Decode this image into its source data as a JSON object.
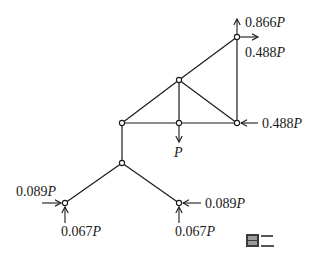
{
  "figure": {
    "caption": "图二",
    "caption_glyph_rendered": "图 (pixelated) + 二"
  },
  "structure": {
    "nodes": [
      {
        "id": "A",
        "x": 237,
        "y": 37,
        "role": "top-right"
      },
      {
        "id": "B",
        "x": 179,
        "y": 80,
        "role": "upper-middle"
      },
      {
        "id": "C",
        "x": 122,
        "y": 123,
        "role": "left"
      },
      {
        "id": "D",
        "x": 179,
        "y": 123,
        "role": "middle"
      },
      {
        "id": "E",
        "x": 237,
        "y": 123,
        "role": "right"
      },
      {
        "id": "F",
        "x": 122,
        "y": 163,
        "role": "junction"
      },
      {
        "id": "G",
        "x": 65,
        "y": 203,
        "role": "support-left"
      },
      {
        "id": "H",
        "x": 179,
        "y": 203,
        "role": "support-right"
      }
    ],
    "members": [
      [
        "C",
        "B"
      ],
      [
        "B",
        "A"
      ],
      [
        "A",
        "E"
      ],
      [
        "B",
        "D"
      ],
      [
        "B",
        "E"
      ],
      [
        "C",
        "D"
      ],
      [
        "D",
        "E"
      ],
      [
        "C",
        "F"
      ],
      [
        "F",
        "G"
      ],
      [
        "F",
        "H"
      ]
    ]
  },
  "loads": {
    "top_up": {
      "node": "A",
      "direction": "up",
      "value": "0.866",
      "unit": "P"
    },
    "top_right": {
      "node": "A",
      "direction": "right",
      "value": "0.488",
      "unit": "P"
    },
    "right_left": {
      "node": "E",
      "direction": "left",
      "value": "0.488",
      "unit": "P"
    },
    "middle_down": {
      "node": "D",
      "direction": "down",
      "value": "",
      "unit": "P"
    },
    "left_support_h": {
      "node": "G",
      "direction": "right",
      "value": "0.089",
      "unit": "P"
    },
    "left_support_v": {
      "node": "G",
      "direction": "up",
      "value": "0.067",
      "unit": "P"
    },
    "right_support_h": {
      "node": "H",
      "direction": "left",
      "value": "0.089",
      "unit": "P"
    },
    "right_support_v": {
      "node": "H",
      "direction": "up",
      "value": "0.067",
      "unit": "P"
    }
  }
}
